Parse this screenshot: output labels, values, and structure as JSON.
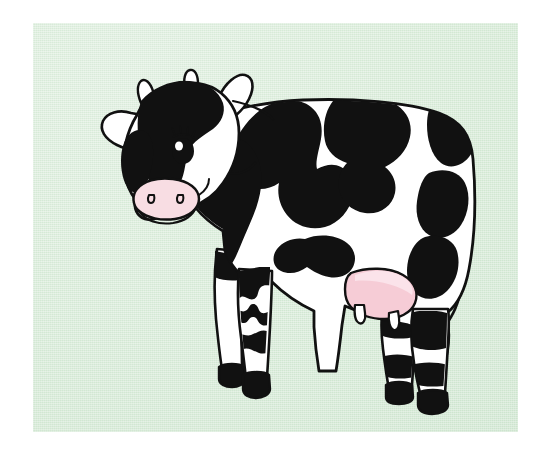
{
  "image": {
    "subject": "cow",
    "style": "flat-vector-clip-art",
    "breed_pattern": "holstein-black-and-white",
    "orientation": "side-profile-facing-left",
    "background_label": "mint green painted panel",
    "canvas_label": "white page margin"
  },
  "colors": {
    "page": "#ffffff",
    "panel_green": "#d9ecd9",
    "panel_green_shade": "#c9e2ca",
    "body_white": "#ffffff",
    "patch_black": "#111111",
    "outline": "#111111",
    "muzzle_pink": "#f8dde3",
    "udder_pink": "#f6ccd6",
    "udder_pink_light": "#fbe3ea",
    "eye_black": "#111111",
    "eye_highlight": "#ffffff",
    "leg_shadow": "#eef2ee"
  },
  "panel": {
    "x": 33,
    "y": 23,
    "width": 485,
    "height": 409
  },
  "parts": [
    {
      "id": "head",
      "label": "Head"
    },
    {
      "id": "left-ear",
      "label": "Left ear"
    },
    {
      "id": "right-ear",
      "label": "Right ear"
    },
    {
      "id": "left-horn",
      "label": "Left horn"
    },
    {
      "id": "right-horn",
      "label": "Right horn"
    },
    {
      "id": "eye",
      "label": "Eye"
    },
    {
      "id": "eyelashes",
      "label": "Eyelashes"
    },
    {
      "id": "muzzle",
      "label": "Muzzle"
    },
    {
      "id": "nostrils",
      "label": "Nostrils"
    },
    {
      "id": "neck",
      "label": "Neck"
    },
    {
      "id": "body",
      "label": "Body"
    },
    {
      "id": "back-patch-1",
      "label": "Back patch"
    },
    {
      "id": "back-patch-2",
      "label": "Rear back patch"
    },
    {
      "id": "rump-patch",
      "label": "Rump patch"
    },
    {
      "id": "shoulder-patch",
      "label": "Shoulder patch"
    },
    {
      "id": "belly-patch",
      "label": "Belly patch"
    },
    {
      "id": "udder",
      "label": "Udder"
    },
    {
      "id": "teats",
      "label": "Teats"
    },
    {
      "id": "tail",
      "label": "Tail"
    },
    {
      "id": "tail-tuft",
      "label": "Tail tuft"
    },
    {
      "id": "front-leg-near",
      "label": "Near front leg"
    },
    {
      "id": "front-leg-far",
      "label": "Far front leg"
    },
    {
      "id": "hind-leg-near",
      "label": "Near hind leg"
    },
    {
      "id": "hind-leg-far",
      "label": "Far hind leg"
    },
    {
      "id": "hooves",
      "label": "Hooves"
    }
  ],
  "caption": {
    "title": "",
    "alt_text": "Illustration of a black and white Holstein dairy cow standing in profile on a mint green background"
  }
}
